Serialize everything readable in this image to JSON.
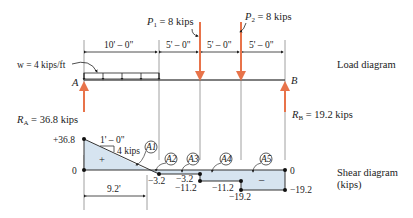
{
  "load_diagram": {
    "label": "Load diagram",
    "support_left": "A",
    "support_right": "B",
    "distributed_load": "w = 4 kips/ft",
    "point_loads": [
      {
        "name": "P",
        "sub": "1",
        "value": " = 8 kips"
      },
      {
        "name": "P",
        "sub": "2",
        "value": " = 8 kips"
      }
    ],
    "dimensions": [
      "10' – 0\"",
      "5' – 0\"",
      "5' – 0\"",
      "5' – 0\""
    ],
    "reactions": [
      {
        "name": "R",
        "sub": "A",
        "value": " = 36.8 kips"
      },
      {
        "name": "R",
        "sub": "B",
        "value": " = 19.2 kips"
      }
    ]
  },
  "shear_diagram": {
    "label_line1": "Shear diagram",
    "label_line2": "(kips)",
    "slope_note_run": "1' – 0\"",
    "slope_note_rise": "4 kips",
    "plus_sign": "+",
    "minus_sign": "–",
    "zero_crossing": "9.2'",
    "areas": [
      "A1",
      "A2",
      "A3",
      "A4",
      "A5"
    ],
    "values": {
      "start": "+36.8",
      "zero_left": "0",
      "zero_right": "0",
      "v1": "−3.2",
      "v2": "−3.2",
      "v3": "−11.2",
      "v4": "−11.2",
      "v5": "−19.2",
      "v6": "−19.2"
    }
  },
  "colors": {
    "load_arrow": "#e8734a",
    "shear_fill": "#d6e4f0",
    "line": "#333333"
  }
}
